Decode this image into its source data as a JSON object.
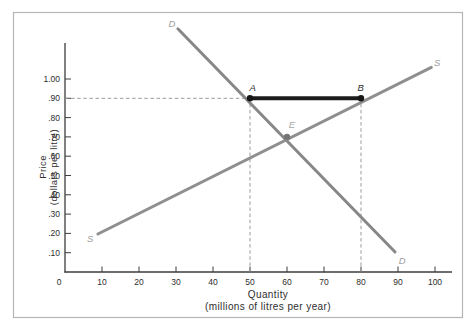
{
  "figure": {
    "background": "#ffffff",
    "frame_color": "#b5b5b5"
  },
  "chart_data": {
    "type": "line",
    "title": "",
    "xlabel": [
      "Quantity",
      "(millions of litres per year)"
    ],
    "ylabel": [
      "Price",
      "(dollars per litre)"
    ],
    "x_ticks": [
      0,
      10,
      20,
      30,
      40,
      50,
      60,
      70,
      80,
      90,
      100
    ],
    "y_tick_labels": [
      "1.00",
      ".90",
      ".80",
      ".70",
      ".60",
      ".50",
      ".40",
      ".30",
      ".20",
      ".10"
    ],
    "xlim": [
      0,
      104.5
    ],
    "ylim": [
      0,
      1.19
    ],
    "grid": false,
    "axis_color": "#3c3c3c",
    "tick_label_color": "#2e2e2e",
    "series": [
      {
        "name": "demand",
        "label": "D",
        "color": "#878787",
        "label_color": "#9e9e9e",
        "points": [
          [
            30.5,
            1.26
          ],
          [
            89.2,
            0.104
          ]
        ],
        "label_positions": [
          [
            28.9,
            1.285
          ],
          [
            91.1,
            0.062
          ]
        ]
      },
      {
        "name": "supply",
        "label": "S",
        "color": "#8f8f8f",
        "label_color": "#9e9e9e",
        "points": [
          [
            8.9,
            0.197
          ],
          [
            99.0,
            1.06
          ]
        ],
        "label_positions": [
          [
            6.8,
            0.176
          ],
          [
            100.6,
            1.085
          ]
        ]
      }
    ],
    "markers": [
      {
        "label": "A",
        "q": 50,
        "p": 0.9,
        "dot_color": "#161616",
        "label_color": "#2b2b2b",
        "label_pos": [
          50.7,
          0.958
        ]
      },
      {
        "label": "B",
        "q": 80,
        "p": 0.9,
        "dot_color": "#161616",
        "label_color": "#2b2b2b",
        "label_pos": [
          79.9,
          0.958
        ]
      },
      {
        "label": "E",
        "q": 60,
        "p": 0.7,
        "dot_color": "#757575",
        "label_color": "#a8a8a8",
        "label_pos": [
          61.3,
          0.762
        ]
      }
    ],
    "segment_AB": {
      "from_q": 50,
      "to_q": 80,
      "p": 0.9,
      "color": "#1b1b1b",
      "width": 4
    },
    "dashed_guides": {
      "color": "#9a9a9a",
      "horizontal": {
        "p": 0.9,
        "from_q": 0,
        "to_q": 50
      },
      "vertical": [
        {
          "q": 50,
          "from_p": 0,
          "to_p": 0.9
        },
        {
          "q": 80,
          "from_p": 0,
          "to_p": 0.9
        }
      ]
    }
  }
}
